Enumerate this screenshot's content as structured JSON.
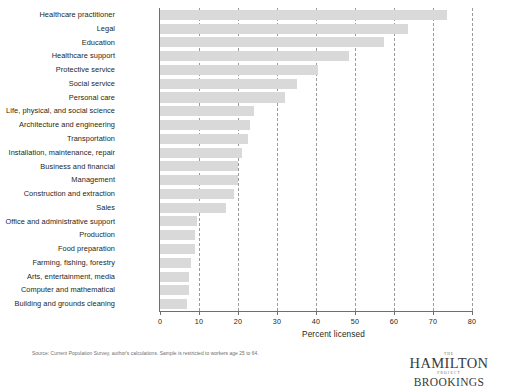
{
  "chart_data": {
    "type": "bar",
    "orientation": "horizontal",
    "title": "",
    "xlabel": "Percent licensed",
    "ylabel": "",
    "xlim": [
      0,
      80
    ],
    "xticks": [
      0,
      10,
      20,
      30,
      40,
      50,
      60,
      70,
      80
    ],
    "grid": "vertical-dashed",
    "legend": "none",
    "bar_color": "#d9d9d9",
    "categories": [
      "Healthcare practitioner",
      "Legal",
      "Education",
      "Healthcare support",
      "Protective service",
      "Social service",
      "Personal care",
      "Life, physical, and social science",
      "Architecture and engineering",
      "Transportation",
      "Installation, maintenance, repair",
      "Business and financial",
      "Management",
      "Construction and extraction",
      "Sales",
      "Office and administrative support",
      "Production",
      "Food preparation",
      "Farming, fishing, forestry",
      "Arts, entertainment, media",
      "Computer and mathematical",
      "Building and grounds cleaning"
    ],
    "values": [
      73.5,
      63.5,
      57.5,
      48.5,
      40.5,
      35,
      32,
      24,
      23,
      22.5,
      21,
      20,
      20,
      19,
      17,
      9.5,
      9,
      9,
      8,
      7.5,
      7.5,
      7
    ]
  },
  "notes": {
    "source": "Source: Current Population Survey, author's calculations. Sample is restricted to workers age 25 to 64."
  },
  "logo": {
    "the": "THE",
    "hamilton": "HAMILTON",
    "project": "PROJECT",
    "brookings": "BROOKINGS"
  }
}
